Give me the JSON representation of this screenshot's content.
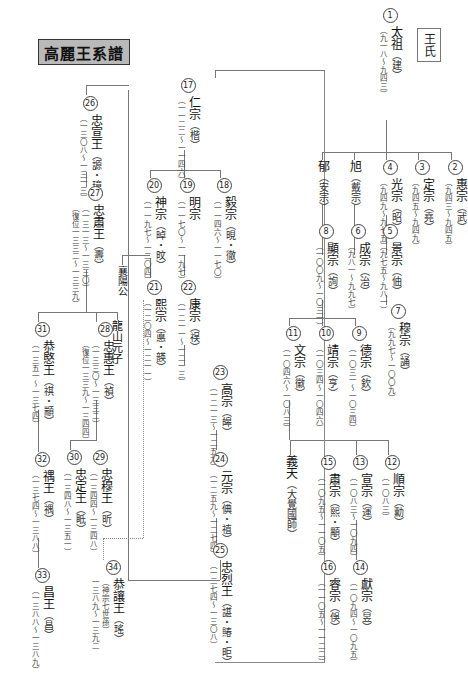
{
  "title": "高麗王系譜",
  "clan_label": "王氏",
  "kings": {
    "k1": {
      "num": "1",
      "name": "太祖",
      "personal": "（建）",
      "dates": "（九一八～九四三）"
    },
    "k2": {
      "num": "2",
      "name": "惠宗",
      "personal": "（武）",
      "dates": "（九四三～九四五）"
    },
    "k3": {
      "num": "3",
      "name": "定宗",
      "personal": "（堯）",
      "dates": "（九四五～九四九）"
    },
    "k4": {
      "num": "4",
      "name": "光宗",
      "personal": "（昭）",
      "dates": "（九四九～九七五）"
    },
    "k5": {
      "num": "5",
      "name": "景宗",
      "personal": "（伷）",
      "dates": "（九七五～九八一）"
    },
    "k6": {
      "num": "6",
      "name": "成宗",
      "personal": "（治）",
      "dates": "（九八一～九九七）"
    },
    "k7": {
      "num": "7",
      "name": "穆宗",
      "personal": "（誦）",
      "dates": "（九九七～一〇〇九）"
    },
    "k8": {
      "num": "8",
      "name": "顯宗",
      "personal": "（詢）",
      "dates": "（一〇〇九～一〇三一）"
    },
    "k9": {
      "num": "9",
      "name": "德宗",
      "personal": "（欽）",
      "dates": "（一〇三一～一〇三四）"
    },
    "k10": {
      "num": "10",
      "name": "靖宗",
      "personal": "（亨）",
      "dates": "（一〇三四～一〇四六）"
    },
    "k11": {
      "num": "11",
      "name": "文宗",
      "personal": "（徽）",
      "dates": "（一〇四六～一〇八三）"
    },
    "k12": {
      "num": "12",
      "name": "順宗",
      "personal": "（勳）",
      "dates": "（一〇八三）"
    },
    "k13": {
      "num": "13",
      "name": "宣宗",
      "personal": "（運）",
      "dates": "（一〇八三～一〇九四）"
    },
    "k14": {
      "num": "14",
      "name": "獻宗",
      "personal": "（昱）",
      "dates": "（一〇九四～一〇九五）"
    },
    "k15": {
      "num": "15",
      "name": "肅宗",
      "personal": "（熙・顒）",
      "dates": "（一〇九五～一一〇五）"
    },
    "k16": {
      "num": "16",
      "name": "睿宗",
      "personal": "（俁）",
      "dates": "（一一〇五～一一二二）"
    },
    "k17": {
      "num": "17",
      "name": "仁宗",
      "personal": "（楷）",
      "dates": "（一一二二～一一四六）"
    },
    "k18": {
      "num": "18",
      "name": "毅宗",
      "personal": "（晛・徹）",
      "dates": "（一一四六～一一七〇）"
    },
    "k19": {
      "num": "19",
      "name": "明宗",
      "personal": "",
      "dates": "（一一七〇～一一九七）"
    },
    "k20": {
      "num": "20",
      "name": "神宗",
      "personal": "（晫・旼）",
      "dates": "（一一九七～一二〇四）"
    },
    "k21": {
      "num": "21",
      "name": "熙宗",
      "personal": "（悳・韺）",
      "dates": "（一二〇四～一二一一）"
    },
    "k22": {
      "num": "22",
      "name": "康宗",
      "personal": "（祦）",
      "dates": "（一二一一～一二一三）"
    },
    "k23": {
      "num": "23",
      "name": "高宗",
      "personal": "（皞）",
      "dates": "（一二一三～一二五九）"
    },
    "k24": {
      "num": "24",
      "name": "元宗",
      "personal": "（倎・禃）",
      "dates": "（一二五九～一二七四）"
    },
    "k25": {
      "num": "25",
      "name": "忠烈王",
      "personal": "（諶・賰・昛）",
      "dates": "（一二七四～一三〇八）"
    },
    "k26": {
      "num": "26",
      "name": "忠宣王",
      "personal": "（謜・璋）",
      "dates": "（一三〇八～一三一三）"
    },
    "k27": {
      "num": "27",
      "name": "忠肅王",
      "personal": "（燾）",
      "dates": "（一三一三～一三三〇）",
      "restored": "（復位一三三二～一三三九）"
    },
    "k28": {
      "num": "28",
      "name": "忠惠王",
      "personal": "（禎）",
      "dates": "（一三三〇～一三三二）",
      "restored": "（復位一三三九～一三四四）"
    },
    "k29": {
      "num": "29",
      "name": "忠穆王",
      "personal": "（昕）",
      "dates": "（一三四四～一三四八）"
    },
    "k30": {
      "num": "30",
      "name": "忠定王",
      "personal": "（眡）",
      "dates": "（一三四八～一三五一）"
    },
    "k31": {
      "num": "31",
      "name": "恭愍王",
      "personal": "（祺・顓）",
      "dates": "（一三五一～一三七四）"
    },
    "k32": {
      "num": "32",
      "name": "禑王",
      "personal": "（禑）",
      "dates": "（一三七四～一三八八）"
    },
    "k33": {
      "num": "33",
      "name": "昌王",
      "personal": "（昌）",
      "dates": "（一三八八～一三八九）"
    },
    "k34": {
      "num": "34",
      "name": "恭讓王",
      "personal": "（瑤）",
      "dates": "一三八九～一三九二",
      "note": "（神宗七世孫）"
    }
  },
  "others": {
    "yu": {
      "name": "郁",
      "title": "（安宗）"
    },
    "uk": {
      "name": "旭",
      "title": "（戴宗）"
    },
    "uicheon": {
      "name": "義天",
      "title": "（大覺國師）"
    },
    "yangyang": {
      "name": "襄陽公"
    },
    "yongsan": {
      "name": "龍山元子"
    }
  }
}
